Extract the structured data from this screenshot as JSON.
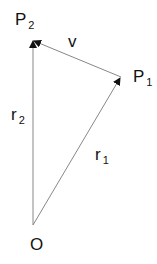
{
  "diagram": {
    "type": "vector-triangle",
    "points": {
      "O": {
        "label": "O",
        "x": 33,
        "y": 225
      },
      "P1": {
        "label": "P",
        "sub": "1",
        "x": 121,
        "y": 77
      },
      "P2": {
        "label": "P",
        "sub": "2",
        "x": 33,
        "y": 40
      }
    },
    "vectors": [
      {
        "name": "r1",
        "label": "r",
        "sub": "1",
        "from": "O",
        "to": "P1"
      },
      {
        "name": "r2",
        "label": "r",
        "sub": "2",
        "from": "O",
        "to": "P2"
      },
      {
        "name": "v",
        "label": "v",
        "from": "P1",
        "to": "P2"
      }
    ],
    "colors": {
      "line": "#888888",
      "arrow": "#111111",
      "text": "#111111"
    }
  }
}
